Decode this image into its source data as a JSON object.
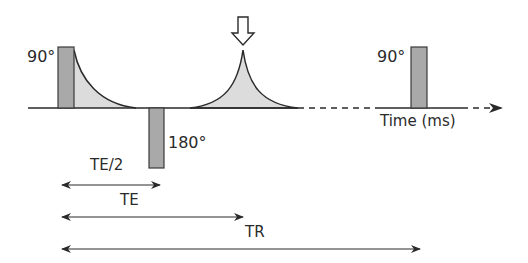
{
  "diagram": {
    "colors": {
      "pulse_fill": "#a9a9a9",
      "pulse_stroke": "#3a3a3a",
      "signal_fill": "#dcdcdc",
      "line": "#2a2a2a",
      "background": "#ffffff"
    },
    "pulses": [
      {
        "label": "90°",
        "position": "first excitation"
      },
      {
        "label": "180°",
        "position": "refocusing"
      },
      {
        "label": "90°",
        "position": "next excitation"
      }
    ],
    "signals": [
      "FID",
      "Echo"
    ],
    "echo_marker": "arrow-down",
    "axis_label": "Time (ms)",
    "intervals": [
      {
        "label": "TE/2"
      },
      {
        "label": "TE"
      },
      {
        "label": "TR"
      }
    ]
  }
}
